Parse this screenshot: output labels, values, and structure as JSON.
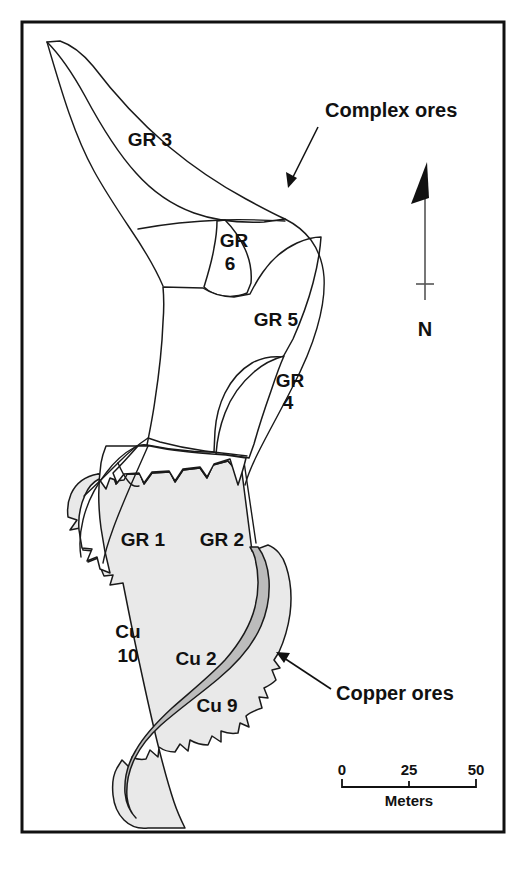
{
  "figure": {
    "kind": "geological-ore-body-map",
    "frame_color": "#111111",
    "background_color": "#ffffff"
  },
  "units": {
    "complex_ore_fill": "#ffffff",
    "copper_outer_fill": "#e9e9e9",
    "copper_inner_fill": "#bcbcbc",
    "outline_color": "#1a1a1a",
    "items": [
      {
        "id": "gr3",
        "label": "GR 3",
        "x": 150,
        "y": 146,
        "anchor": "middle",
        "type": "complex"
      },
      {
        "id": "gr6",
        "label_line1": "GR",
        "label_line2": "6",
        "x": 234,
        "y": 247,
        "anchor": "middle",
        "type": "complex"
      },
      {
        "id": "gr5",
        "label": "GR 5",
        "x": 276,
        "y": 326,
        "anchor": "middle",
        "type": "complex"
      },
      {
        "id": "gr4",
        "label_line1": "GR",
        "label_line2": "4",
        "x": 290,
        "y": 387,
        "anchor": "middle",
        "type": "complex"
      },
      {
        "id": "gr1",
        "label": "GR 1",
        "x": 143,
        "y": 546,
        "anchor": "middle",
        "type": "complex"
      },
      {
        "id": "gr2",
        "label": "GR 2",
        "x": 222,
        "y": 546,
        "anchor": "middle",
        "type": "complex"
      },
      {
        "id": "cu10",
        "label_line1": "Cu",
        "label_line2": "10",
        "x": 129,
        "y": 638,
        "anchor": "middle",
        "type": "copper-outer"
      },
      {
        "id": "cu2",
        "label": "Cu 2",
        "x": 196,
        "y": 663,
        "anchor": "middle",
        "type": "copper-inner"
      },
      {
        "id": "cu9",
        "label": "Cu 9",
        "x": 217,
        "y": 712,
        "anchor": "middle",
        "type": "copper-outer"
      }
    ]
  },
  "annotations": [
    {
      "id": "complex-ores",
      "label": "Complex ores",
      "text_x": 325,
      "text_y": 117,
      "anchor": "start",
      "leader": {
        "x1": 318,
        "y1": 127,
        "x2": 288,
        "y2": 185
      },
      "arrow_at": "end"
    },
    {
      "id": "copper-ores",
      "label": "Copper ores",
      "text_x": 336,
      "text_y": 700,
      "anchor": "start",
      "leader": {
        "x1": 331,
        "y1": 689,
        "x2": 277,
        "y2": 653
      },
      "arrow_at": "end"
    }
  ],
  "compass": {
    "id": "north-arrow",
    "label": "N",
    "label_x": 425,
    "label_y": 336,
    "stem": {
      "x": 425,
      "y_top": 193,
      "y_bottom": 300
    },
    "tick": {
      "x": 425,
      "y": 284,
      "half_width": 9
    },
    "arrowhead": {
      "apex_x": 427,
      "apex_y": 163,
      "base_left_x": 412,
      "base_left_y": 203,
      "base_right_x": 428,
      "base_right_y": 196
    }
  },
  "scale_bar": {
    "id": "scale-bar",
    "caption": "Meters",
    "caption_x": 409,
    "caption_y": 806,
    "ticks": [
      {
        "label": "0",
        "x": 342
      },
      {
        "label": "25",
        "x": 409
      },
      {
        "label": "50",
        "x": 476
      }
    ],
    "label_y": 775,
    "rule_y": 786,
    "tick_drop": 7,
    "x_start": 342,
    "x_end": 476
  },
  "frame": {
    "x": 22,
    "y": 22,
    "width": 482,
    "height": 810
  }
}
